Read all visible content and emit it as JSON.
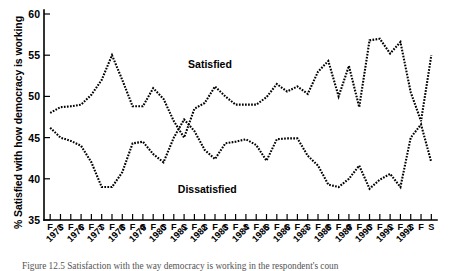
{
  "figure": {
    "caption": "Figure 12.5  Satisfaction with the way democracy is working in the respondent's coun"
  },
  "chart_data": {
    "type": "line",
    "title": "",
    "xlabel": "",
    "ylabel": "% Satisfied with how democracy is working",
    "ylim": [
      35,
      60
    ],
    "yticks": [
      35,
      40,
      45,
      50,
      55,
      60
    ],
    "ytick_labels": [
      "35",
      "40",
      "45",
      "50",
      "55",
      "60"
    ],
    "grid": false,
    "legend_position": "inline-annotation",
    "annotations": [
      {
        "text": "Satisfied",
        "x_index": 13,
        "y_value": 53.8
      },
      {
        "text": "Dissatisfied",
        "x_index": 12,
        "y_value": 38.6
      }
    ],
    "season_labels": [
      "F",
      "S",
      "F",
      "S",
      "F",
      "S",
      "F",
      "S",
      "F",
      "S",
      "F",
      "S",
      "F",
      "S",
      "F",
      "S",
      "F",
      "S",
      "F",
      "S",
      "F",
      "S",
      "F",
      "S",
      "F",
      "S",
      "F",
      "S",
      "F",
      "S",
      "F",
      "S",
      "F",
      "S",
      "F",
      "S",
      "F",
      "S"
    ],
    "year_labels": [
      "1973",
      "1976",
      "1977",
      "1978",
      "1979",
      "1980",
      "1981",
      "1982",
      "1983",
      "1984",
      "1985",
      "1986",
      "1987",
      "1988",
      "1989",
      "1990",
      "1991",
      "1992"
    ],
    "year_label_positions": [
      0,
      2,
      4,
      6,
      8,
      10,
      12,
      14,
      16,
      18,
      20,
      22,
      24,
      26,
      28,
      30,
      32,
      34
    ],
    "x": [
      0,
      1,
      2,
      3,
      4,
      5,
      6,
      7,
      8,
      9,
      10,
      11,
      12,
      13,
      14,
      15,
      16,
      17,
      18,
      19,
      20,
      21,
      22,
      23,
      24,
      25,
      26,
      27,
      28,
      29,
      30,
      31,
      32,
      33,
      34,
      35,
      36,
      37
    ],
    "series": [
      {
        "name": "Satisfied",
        "values": [
          48.0,
          48.7,
          48.8,
          49.0,
          50.2,
          52.0,
          55.0,
          52.0,
          48.8,
          48.8,
          51.0,
          49.7,
          47.0,
          45.0,
          48.5,
          49.2,
          51.2,
          50.0,
          49.0,
          49.0,
          49.0,
          49.9,
          51.5,
          50.6,
          51.2,
          50.3,
          53.0,
          54.3,
          50.0,
          53.7,
          48.7,
          56.8,
          57.0,
          55.2,
          56.6,
          50.5,
          47.0,
          55.0
        ]
      },
      {
        "name": "Dissatisfied",
        "values": [
          46.2,
          45.0,
          44.6,
          44.0,
          42.0,
          39.0,
          39.0,
          40.8,
          44.3,
          44.5,
          43.0,
          42.0,
          45.0,
          47.2,
          45.8,
          43.5,
          42.4,
          44.3,
          44.5,
          44.8,
          44.1,
          42.2,
          44.8,
          44.9,
          44.9,
          42.8,
          41.6,
          39.3,
          39.0,
          40.0,
          41.6,
          38.8,
          39.9,
          40.6,
          39.0,
          45.0,
          46.6,
          42.0
        ]
      }
    ]
  }
}
